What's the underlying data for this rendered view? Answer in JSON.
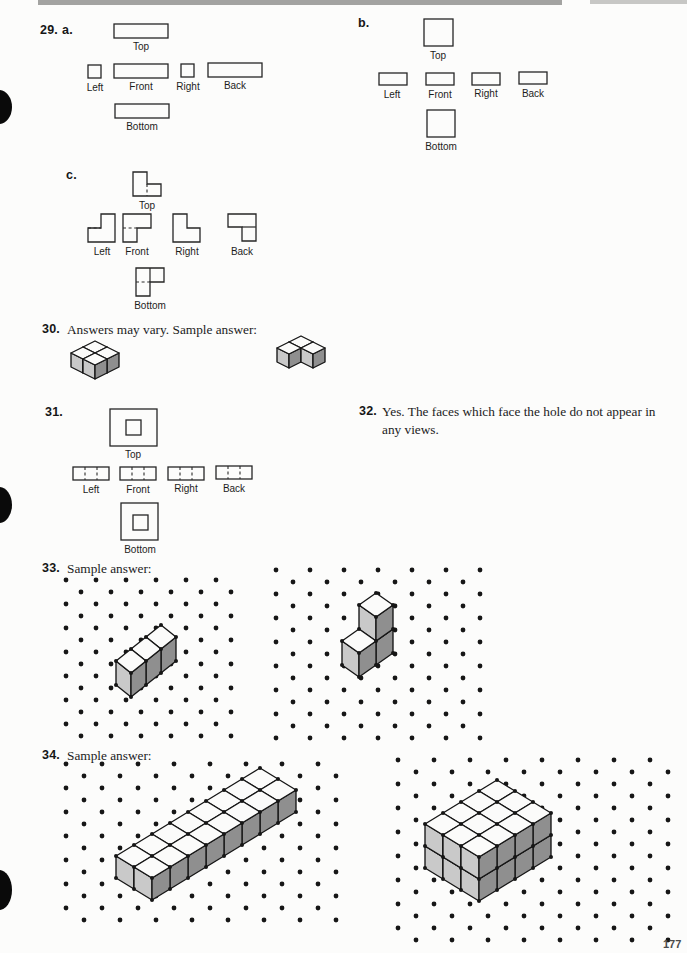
{
  "page": {
    "number": "177"
  },
  "colors": {
    "cube_top": "#fbfbfa",
    "cube_left": "#c9c9c9",
    "cube_right": "#8f8f8f",
    "ink": "#161616"
  },
  "problems": {
    "p29": {
      "number": "29.",
      "parts": {
        "a": {
          "label": "a.",
          "views": {
            "top": "Top",
            "left": "Left",
            "front": "Front",
            "right": "Right",
            "back": "Back",
            "bottom": "Bottom"
          }
        },
        "b": {
          "label": "b.",
          "views": {
            "top": "Top",
            "left": "Left",
            "front": "Front",
            "right": "Right",
            "back": "Back",
            "bottom": "Bottom"
          }
        },
        "c": {
          "label": "c.",
          "views": {
            "top": "Top",
            "left": "Left",
            "front": "Front",
            "right": "Right",
            "back": "Back",
            "bottom": "Bottom"
          }
        }
      }
    },
    "p30": {
      "number": "30.",
      "text": "Answers may vary. Sample answer:"
    },
    "p31": {
      "number": "31.",
      "views": {
        "top": "Top",
        "left": "Left",
        "front": "Front",
        "right": "Right",
        "back": "Back",
        "bottom": "Bottom"
      }
    },
    "p32": {
      "number": "32.",
      "text": "Yes. The faces which face the hole do not appear in any views."
    },
    "p33": {
      "number": "33.",
      "text": "Sample answer:"
    },
    "p34": {
      "number": "34.",
      "text": "Sample answer:"
    }
  },
  "figures": {
    "fig30a": {
      "origin": [
        95,
        379
      ],
      "hx": 12,
      "hy": 6,
      "v": 14,
      "cubes": [
        [
          0,
          1,
          0
        ],
        [
          1,
          1,
          0
        ],
        [
          0,
          0,
          0
        ],
        [
          1,
          0,
          0
        ]
      ],
      "vertex_dots": false
    },
    "fig30b": {
      "origin": [
        301,
        374
      ],
      "hx": 12,
      "hy": 6,
      "v": 14,
      "cubes": [
        [
          0,
          1,
          0
        ],
        [
          1,
          1,
          0
        ],
        [
          1,
          0,
          0
        ]
      ],
      "vertex_dots": false
    },
    "fig33a": {
      "origin": [
        131,
        697
      ],
      "hx": 15,
      "hy": 12,
      "v": 24,
      "cubes": [
        [
          0,
          0,
          0
        ],
        [
          1,
          0,
          0
        ],
        [
          2,
          0,
          0
        ]
      ],
      "vertex_dots": true,
      "grid": {
        "x": 66,
        "y": 580,
        "w": 168,
        "h": 165,
        "dx": 30,
        "dy": 12,
        "r": 2.4
      }
    },
    "fig33b": {
      "origin": [
        359,
        677
      ],
      "hx": 17,
      "hy": 12,
      "v": 24,
      "cubes": [
        [
          0,
          0,
          0
        ],
        [
          1,
          0,
          0
        ],
        [
          1,
          0,
          1
        ]
      ],
      "vertex_dots": true,
      "grid": {
        "x": 276,
        "y": 570,
        "w": 212,
        "h": 174,
        "dx": 34,
        "dy": 12,
        "r": 2.4
      }
    },
    "fig34a": {
      "origin": [
        152,
        900
      ],
      "hx": 18,
      "hy": 11,
      "v": 22,
      "box": [
        8,
        2,
        1
      ],
      "vertex_dots": true,
      "grid": {
        "x": 66,
        "y": 764,
        "w": 276,
        "h": 164,
        "dx": 36,
        "dy": 12,
        "r": 2.4
      }
    },
    "fig34b": {
      "origin": [
        479,
        901
      ],
      "hx": 18,
      "hy": 11,
      "v": 22,
      "box": [
        4,
        3,
        2
      ],
      "vertex_dots": true,
      "grid": {
        "x": 398,
        "y": 760,
        "w": 283,
        "h": 180,
        "dx": 36,
        "dy": 12,
        "r": 2.4
      }
    }
  }
}
